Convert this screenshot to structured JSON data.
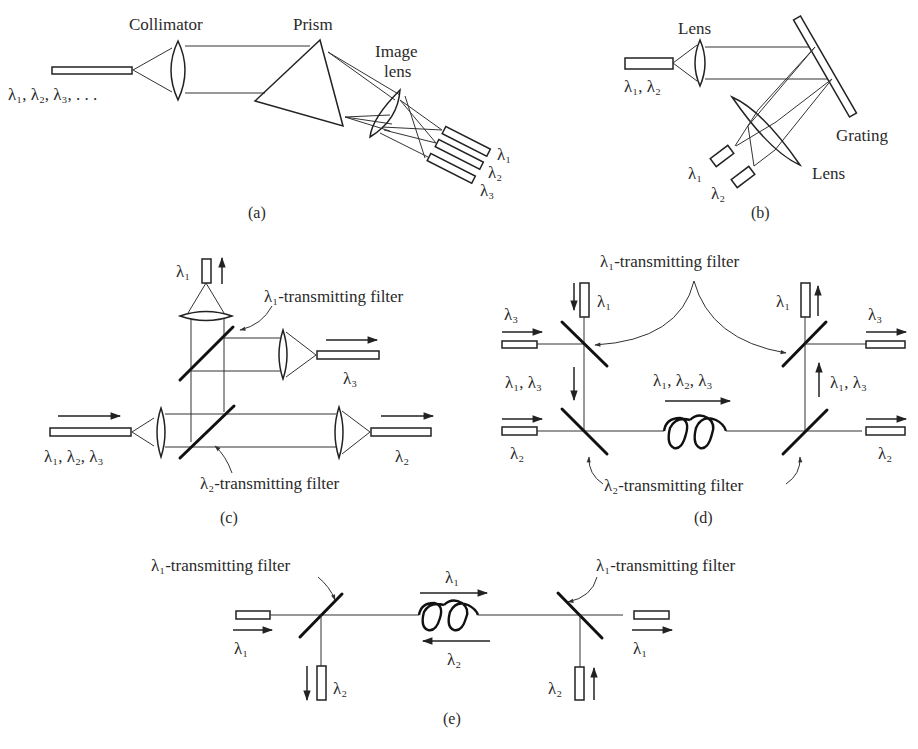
{
  "figure": {
    "panels": [
      {
        "id": "a",
        "caption": "(a)",
        "labels": {
          "collimator": "Collimator",
          "prism": "Prism",
          "image_lens_1": "Image",
          "image_lens_2": "lens",
          "input": "λ₁, λ₂, λ₃, . . .",
          "out1": "λ₁",
          "out2": "λ₂",
          "out3": "λ₃"
        }
      },
      {
        "id": "b",
        "caption": "(b)",
        "labels": {
          "lens_top": "Lens",
          "input": "λ₁, λ₂",
          "grating": "Grating",
          "lens_bottom": "Lens",
          "out1": "λ₁",
          "out2": "λ₂"
        }
      },
      {
        "id": "c",
        "caption": "(c)",
        "labels": {
          "out_top": "λ₁",
          "filter1": "λ₁-transmitting filter",
          "out3": "λ₃",
          "input": "λ₁, λ₂, λ₃",
          "out2": "λ₂",
          "filter2": "λ₂-transmitting filter"
        }
      },
      {
        "id": "d",
        "caption": "(d)",
        "labels": {
          "filter1": "λ₁-transmitting filter",
          "in1": "λ₁",
          "in3": "λ₃",
          "mid_left": "λ₁, λ₃",
          "fiber": "λ₁, λ₂, λ₃",
          "in2": "λ₂",
          "out1": "λ₁",
          "out3": "λ₃",
          "mid_right": "λ₁, λ₃",
          "out2": "λ₂",
          "filter2": "λ₂-transmitting filter"
        }
      },
      {
        "id": "e",
        "caption": "(e)",
        "labels": {
          "filter_left": "λ₁-transmitting filter",
          "filter_right": "λ₁-transmitting filter",
          "fiber_fwd": "λ₁",
          "fiber_back": "λ₂",
          "in1": "λ₁",
          "out_left2": "λ₂",
          "out1": "λ₁",
          "in_right2": "λ₂"
        }
      }
    ]
  }
}
